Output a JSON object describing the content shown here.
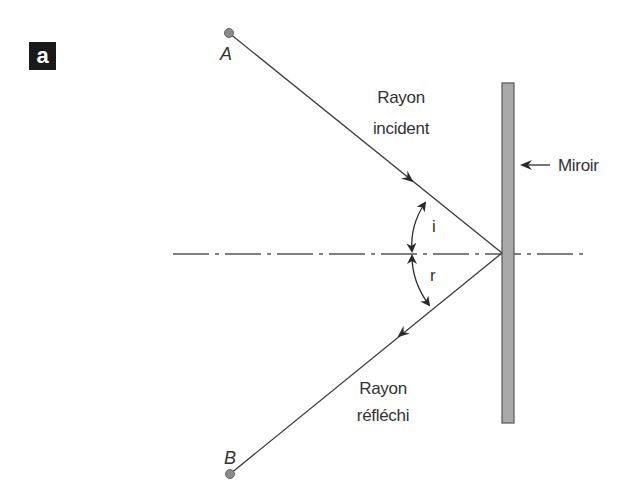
{
  "figure": {
    "badge": "a",
    "colors": {
      "line": "#3a3a3a",
      "mirror_fill": "#a9a9a9",
      "mirror_stroke": "#555555",
      "point_fill": "#8a8a8a",
      "badge_bg": "#1a1a1a",
      "text": "#333333"
    },
    "points": {
      "A": {
        "label": "A",
        "x": 229,
        "y": 33
      },
      "B": {
        "label": "B",
        "x": 230,
        "y": 474
      }
    },
    "incidence_point": {
      "x": 502,
      "y": 253
    },
    "mirror": {
      "label": "Miroir",
      "x": 502,
      "y": 83,
      "width": 12,
      "height": 340
    },
    "normal_line": {
      "x1": 173,
      "x2": 586,
      "y": 254,
      "style": "dash-dot"
    },
    "incident_ray": {
      "line1": "Rayon",
      "line2": "incident"
    },
    "reflected_ray": {
      "line1": "Rayon",
      "line2": "réfléchi"
    },
    "angles": {
      "incidence": "i",
      "reflection": "r"
    }
  }
}
